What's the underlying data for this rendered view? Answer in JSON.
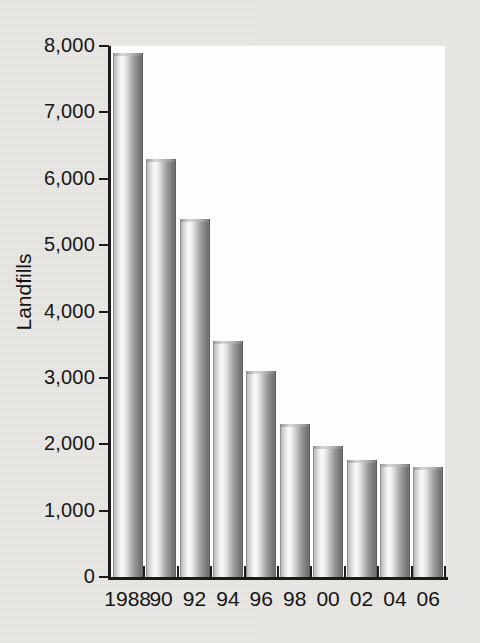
{
  "figure": {
    "background_color": "#eae9e6",
    "plot_background_color": "#fdfdfc",
    "axis_color": "#1b1b1b",
    "bar_color": "#b0b0ae"
  },
  "chart_data": {
    "type": "bar",
    "title": "",
    "subtitle": "",
    "xlabel": "",
    "ylabel": "Landfills",
    "categories": [
      "1988",
      "90",
      "92",
      "94",
      "96",
      "98",
      "00",
      "02",
      "04",
      "06"
    ],
    "values": [
      7900,
      6300,
      5400,
      3550,
      3100,
      2300,
      1970,
      1770,
      1700,
      1650
    ],
    "series": [
      {
        "name": "Landfills",
        "values": [
          7900,
          6300,
          5400,
          3550,
          3100,
          2300,
          1970,
          1770,
          1700,
          1650
        ]
      }
    ],
    "ylim": [
      0,
      8000
    ],
    "y_ticks": [
      0,
      1000,
      2000,
      3000,
      4000,
      5000,
      6000,
      7000,
      8000
    ],
    "y_tick_labels": [
      "0",
      "1,000",
      "2,000",
      "3,000",
      "4,000",
      "5,000",
      "6,000",
      "7,000",
      "8,000"
    ],
    "grid": false,
    "legend": null,
    "legend_position": "none",
    "annotations": []
  }
}
